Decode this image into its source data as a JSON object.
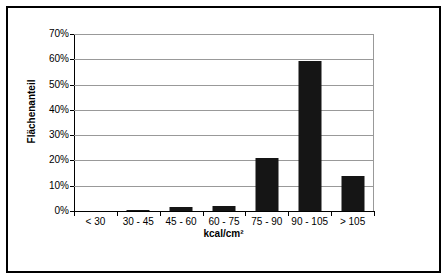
{
  "chart_data": {
    "type": "bar",
    "title": "",
    "subtitle": "",
    "xlabel": "kcal/cm²",
    "ylabel": "Flächenanteil",
    "categories": [
      "< 30",
      "30 - 45",
      "45 - 60",
      "60 - 75",
      "75 - 90",
      "90 - 105",
      "> 105"
    ],
    "values": [
      0,
      0.3,
      1.7,
      2.0,
      21,
      59.5,
      14
    ],
    "value_labels": [
      "0%",
      "0.3%",
      "1.7%",
      "2.0%",
      "21%",
      "59.5%",
      "14%"
    ],
    "ylim": [
      0,
      70
    ],
    "y_ticks": [
      0,
      10,
      20,
      30,
      40,
      50,
      60,
      70
    ],
    "y_tick_labels": [
      "0%",
      "10%",
      "20%",
      "30%",
      "40%",
      "50%",
      "60%",
      "70%"
    ],
    "grid": true,
    "legend": null,
    "legend_position": "none",
    "series": [
      {
        "name": "Flächenanteil",
        "color": "#151515",
        "values": [
          0,
          0.3,
          1.7,
          2.0,
          21,
          59.5,
          14
        ]
      }
    ],
    "annotations": []
  },
  "figure": {
    "border_color": "#000000",
    "background": "#ffffff",
    "gridline_color": "#999999",
    "axis_color": "#000000",
    "bar_color": "#151515"
  }
}
